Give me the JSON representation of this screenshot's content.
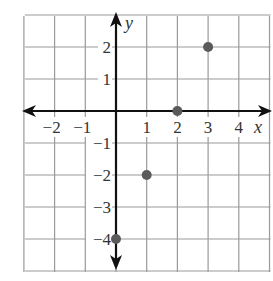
{
  "chart_data": {
    "type": "scatter",
    "title": "",
    "xlabel": "x",
    "ylabel": "y",
    "xlim": [
      -3,
      5
    ],
    "ylim": [
      -5,
      3
    ],
    "grid": true,
    "x_ticks": [
      "-2",
      "-1",
      "1",
      "2",
      "3",
      "4"
    ],
    "y_ticks": [
      "2",
      "1",
      "-1",
      "-2",
      "-3",
      "-4"
    ],
    "points": [
      {
        "x": 0,
        "y": -4
      },
      {
        "x": 1,
        "y": -2
      },
      {
        "x": 2,
        "y": 0
      },
      {
        "x": 3,
        "y": 2
      }
    ],
    "colors": {
      "grid": "#9a9a9a",
      "axis": "#111111",
      "point": "#5a5a5a"
    }
  }
}
